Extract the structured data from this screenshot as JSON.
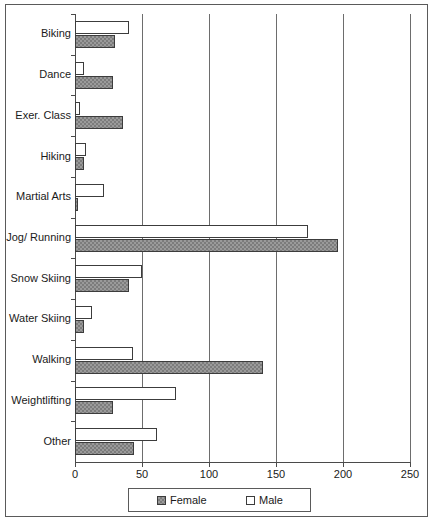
{
  "chart_data": {
    "type": "bar",
    "orientation": "horizontal",
    "title": "",
    "subtitle": "",
    "xlabel": "",
    "ylabel": "",
    "xlim": [
      0,
      250
    ],
    "xticks": [
      0,
      50,
      100,
      150,
      200,
      250
    ],
    "xtick_labels": [
      "0",
      "50",
      "100",
      "150",
      "200",
      "250"
    ],
    "grid": true,
    "grid_axis": "x",
    "legend_position": "bottom",
    "categories": [
      "Biking",
      "Dance",
      "Exer. Class",
      "Hiking",
      "Martial Arts",
      "Jog/ Running",
      "Snow Skiing",
      "Water Skiing",
      "Walking",
      "Weightlifting",
      "Other"
    ],
    "series": [
      {
        "name": "Female",
        "style": "hatched-grey",
        "color": "#9a9a9a",
        "values": [
          30,
          28,
          36,
          7,
          2,
          196,
          40,
          7,
          140,
          28,
          44
        ]
      },
      {
        "name": "Male",
        "style": "white",
        "color": "#ffffff",
        "values": [
          40,
          7,
          4,
          8,
          22,
          174,
          50,
          13,
          43,
          75,
          61
        ]
      }
    ]
  },
  "legend": {
    "entries": [
      {
        "label": "Female",
        "swatch": "female-swatch"
      },
      {
        "label": "Male",
        "swatch": "male-swatch"
      }
    ]
  }
}
